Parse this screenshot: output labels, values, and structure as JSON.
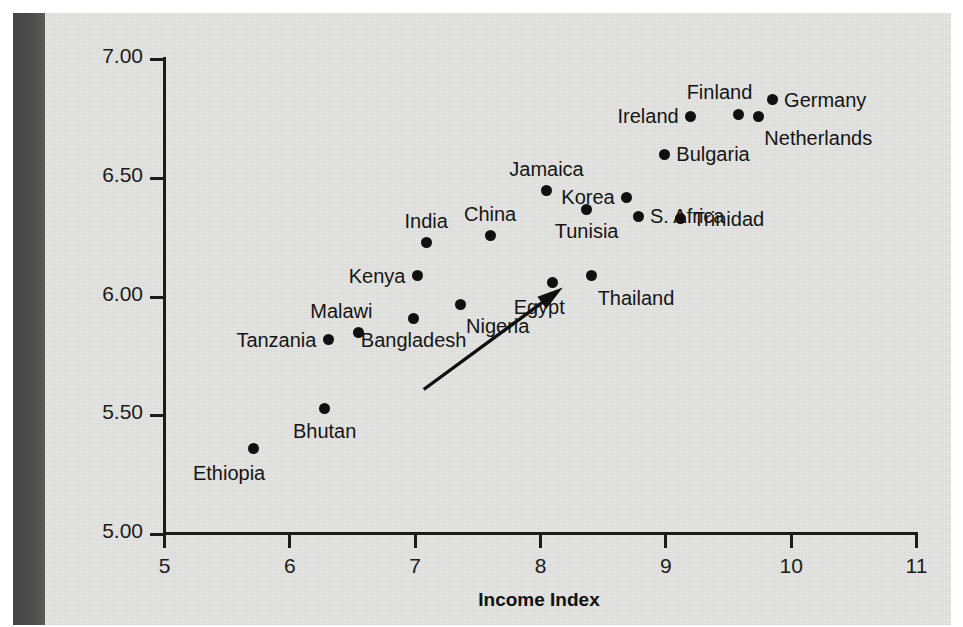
{
  "figure": {
    "background_color": "#e3e3e1",
    "gutter_color": "#4b4b4b",
    "point_color": "#101010"
  },
  "chart_data": {
    "type": "scatter",
    "title": "",
    "xlabel": "Income Index",
    "ylabel": "Environmental Performance Index",
    "xlim": [
      5,
      11
    ],
    "ylim": [
      5.0,
      7.0
    ],
    "xticks": [
      "5",
      "6",
      "7",
      "8",
      "9",
      "10",
      "11"
    ],
    "yticks": [
      "5.00",
      "5.50",
      "6.00",
      "6.50",
      "7.00"
    ],
    "grid": false,
    "legend": null,
    "annotations": [
      {
        "name": "trend-arrow",
        "type": "arrow",
        "from": [
          7.08,
          5.6
        ],
        "to": [
          8.19,
          6.03
        ]
      }
    ],
    "points": [
      {
        "label": "Ethiopia",
        "x": 5.72,
        "y": 5.35,
        "label_pos": "below-left"
      },
      {
        "label": "Bhutan",
        "x": 6.29,
        "y": 5.52,
        "label_pos": "below"
      },
      {
        "label": "Tanzania",
        "x": 6.32,
        "y": 5.81,
        "label_pos": "left"
      },
      {
        "label": "Malawi",
        "x": 6.56,
        "y": 5.84,
        "label_pos": "above-left"
      },
      {
        "label": "Bangladesh",
        "x": 7.0,
        "y": 5.9,
        "label_pos": "below"
      },
      {
        "label": "Kenya",
        "x": 7.03,
        "y": 6.08,
        "label_pos": "left"
      },
      {
        "label": "India",
        "x": 7.1,
        "y": 6.22,
        "label_pos": "above"
      },
      {
        "label": "Nigeria",
        "x": 7.37,
        "y": 5.96,
        "label_pos": "below-right"
      },
      {
        "label": "China",
        "x": 7.61,
        "y": 6.25,
        "label_pos": "above"
      },
      {
        "label": "Egypt",
        "x": 8.11,
        "y": 6.05,
        "label_pos": "below-left"
      },
      {
        "label": "Jamaica",
        "x": 8.06,
        "y": 6.44,
        "label_pos": "above"
      },
      {
        "label": "Thailand",
        "x": 8.42,
        "y": 6.08,
        "label_pos": "below-right"
      },
      {
        "label": "Tunisia",
        "x": 8.38,
        "y": 6.36,
        "label_pos": "below"
      },
      {
        "label": "Korea",
        "x": 8.7,
        "y": 6.41,
        "label_pos": "left"
      },
      {
        "label": "S. Africa",
        "x": 8.79,
        "y": 6.33,
        "label_pos": "right"
      },
      {
        "label": "Bulgaria",
        "x": 9.0,
        "y": 6.59,
        "label_pos": "right"
      },
      {
        "label": "Trinidad",
        "x": 9.13,
        "y": 6.32,
        "label_pos": "right"
      },
      {
        "label": "Ireland",
        "x": 9.21,
        "y": 6.75,
        "label_pos": "left"
      },
      {
        "label": "Finland",
        "x": 9.59,
        "y": 6.76,
        "label_pos": "above-left"
      },
      {
        "label": "Netherlands",
        "x": 9.75,
        "y": 6.75,
        "label_pos": "below-right"
      },
      {
        "label": "Germany",
        "x": 9.86,
        "y": 6.82,
        "label_pos": "right"
      }
    ]
  }
}
